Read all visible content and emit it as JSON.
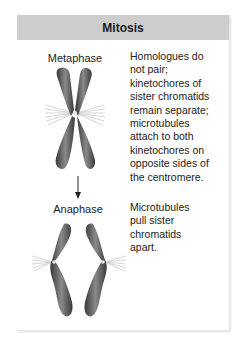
{
  "title": "Mitosis",
  "stages": [
    {
      "name": "Metaphase",
      "description_lines": [
        "Homologues do",
        "not pair;",
        "kinetochores of",
        "sister chromatids",
        "remain separate;",
        "microtubules",
        "attach to both",
        "kinetochores on",
        "opposite sides of",
        "the centromere."
      ]
    },
    {
      "name": "Anaphase",
      "description_lines": [
        "Microtubules",
        "pull sister",
        "chromatids",
        "apart."
      ]
    }
  ],
  "colors": {
    "header_bg": "#cdcdcd",
    "chromosome": "#5a5a5a",
    "spindle": "#bfbfbf"
  }
}
